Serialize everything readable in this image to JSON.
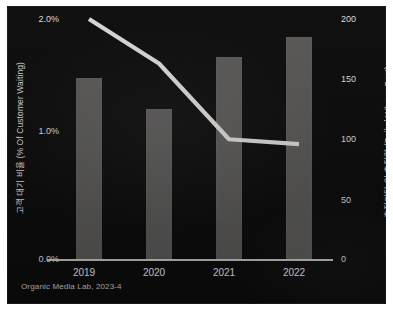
{
  "colors": {
    "panel_background": "#0d0c0c",
    "bar": "#595857",
    "line": "#d9d7d4",
    "axis": "#cfcfcf",
    "tick_text": "#dcdcdc",
    "axis_title": "#d6d6d6",
    "credit_text": "#c9c6c2",
    "page_background": "#ffffff"
  },
  "credit": "Organic Media Lab, 2023-4",
  "chart_data": {
    "type": "bar",
    "title": "",
    "subtitle": "",
    "xlabel": "",
    "categories": [
      "2019",
      "2020",
      "2021",
      "2022"
    ],
    "grid": false,
    "legend": "none",
    "annotations": [
      "Organic Media Lab, 2023-4"
    ],
    "axes": {
      "y_left": {
        "label": "고객 대기 비율 (% Of Customer Waiting)",
        "ticks": [
          "0.0%",
          "1.0%",
          "2.0%"
        ],
        "tick_values": [
          0.0,
          1.0,
          2.0
        ],
        "ylim": [
          0.0,
          2.0
        ],
        "unit": "%"
      },
      "y_right": {
        "label": "충전기당 일 충전량 (Daily kWh per Post)",
        "ticks": [
          "0",
          "50",
          "100",
          "150",
          "200"
        ],
        "tick_values": [
          0,
          50,
          100,
          150,
          200
        ],
        "ylim": [
          0,
          200
        ],
        "unit": "kWh"
      }
    },
    "series": [
      {
        "name": "충전기당 일 충전량 (Daily kWh per Post)",
        "type": "bar",
        "axis": "y_right",
        "values": [
          151,
          125,
          168,
          185
        ]
      },
      {
        "name": "고객 대기 비율 (% Of Customer Waiting)",
        "type": "line",
        "axis": "y_left",
        "values": [
          2.0,
          1.63,
          1.0,
          0.96
        ]
      }
    ]
  }
}
